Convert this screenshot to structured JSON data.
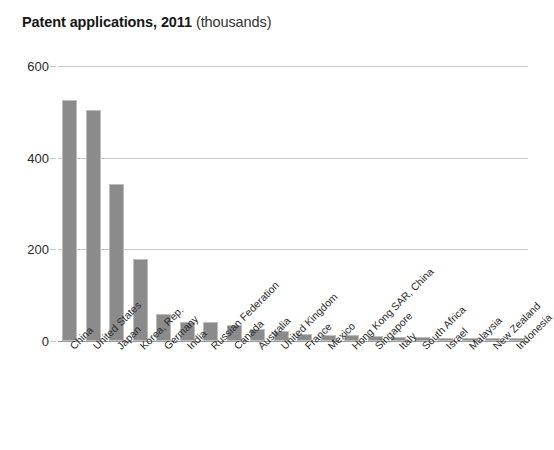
{
  "title": {
    "main": "Patent applications, 2011",
    "unit": "(thousands)"
  },
  "chart_data": {
    "type": "bar",
    "xlabel": "",
    "ylabel": "",
    "ylim": [
      0,
      600
    ],
    "yticks": [
      0,
      200,
      400,
      600
    ],
    "grid": true,
    "legend": "none",
    "bar_color": "#8b8b8b",
    "categories": [
      "China",
      "United States",
      "Japan",
      "Korea, Rep.",
      "Germany",
      "India",
      "Russian Federation",
      "Canada",
      "Australia",
      "United Kingdom",
      "France",
      "Mexico",
      "Hong Kong SAR, China",
      "Singapore",
      "Italy",
      "South Africa",
      "Israel",
      "Malaysia",
      "New Zealand",
      "Indonesia"
    ],
    "values": [
      526,
      504,
      343,
      178,
      59,
      42,
      41,
      35,
      26,
      22,
      16,
      14,
      13,
      10,
      9,
      9,
      7,
      7,
      6,
      6
    ]
  },
  "axis": {
    "y_tick_labels": [
      "600",
      "400",
      "200",
      "0"
    ]
  }
}
